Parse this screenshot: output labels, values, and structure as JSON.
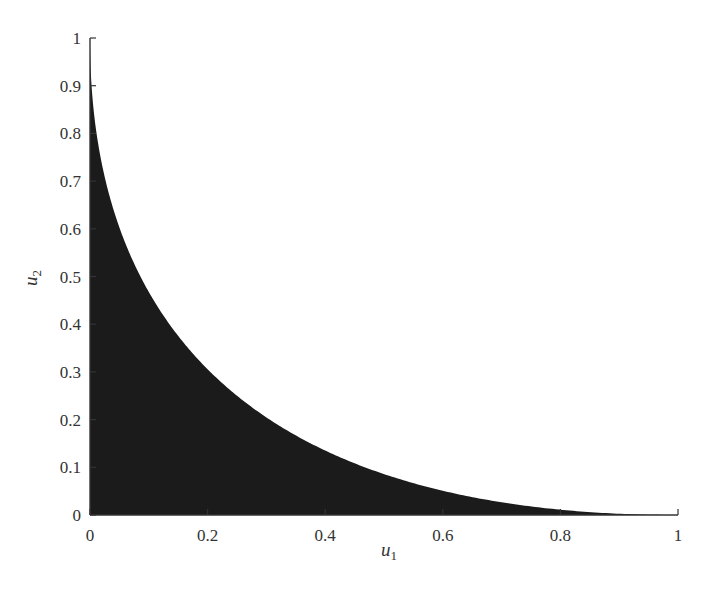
{
  "chart_data": {
    "type": "area",
    "title": "",
    "xlabel": "u",
    "xlabel_subscript": "1",
    "ylabel": "u",
    "ylabel_subscript": "2",
    "xlim": [
      0,
      1
    ],
    "ylim": [
      0,
      1
    ],
    "grid": false,
    "legend": null,
    "fill_color": "#1b1b1b",
    "axis_color": "#333333",
    "x_ticks": [
      0,
      0.2,
      0.4,
      0.6,
      0.8,
      1
    ],
    "x_tick_labels": [
      "0",
      "0.2",
      "0.4",
      "0.6",
      "0.8",
      "1"
    ],
    "y_ticks": [
      0,
      0.1,
      0.2,
      0.3,
      0.4,
      0.5,
      0.6,
      0.7,
      0.8,
      0.9,
      1
    ],
    "y_tick_labels": [
      "0",
      "0.1",
      "0.2",
      "0.3",
      "0.4",
      "0.5",
      "0.6",
      "0.7",
      "0.8",
      "0.9",
      "1"
    ],
    "region_description": "Filled region under boundary sqrt(u1) + sqrt(u2) = 1",
    "series": [
      {
        "name": "boundary",
        "x": [
          0,
          0.005,
          0.01,
          0.02,
          0.036,
          0.05,
          0.075,
          0.1,
          0.15,
          0.2,
          0.25,
          0.3,
          0.35,
          0.4,
          0.45,
          0.5,
          0.55,
          0.6,
          0.65,
          0.7,
          0.75,
          0.8,
          0.85,
          0.9,
          0.95,
          1
        ],
        "values": [
          1,
          0.864,
          0.81,
          0.737,
          0.656,
          0.603,
          0.527,
          0.468,
          0.375,
          0.306,
          0.25,
          0.205,
          0.167,
          0.135,
          0.108,
          0.086,
          0.066,
          0.051,
          0.037,
          0.026,
          0.017,
          0.011,
          0.006,
          0.003,
          0.001,
          0
        ]
      }
    ]
  }
}
